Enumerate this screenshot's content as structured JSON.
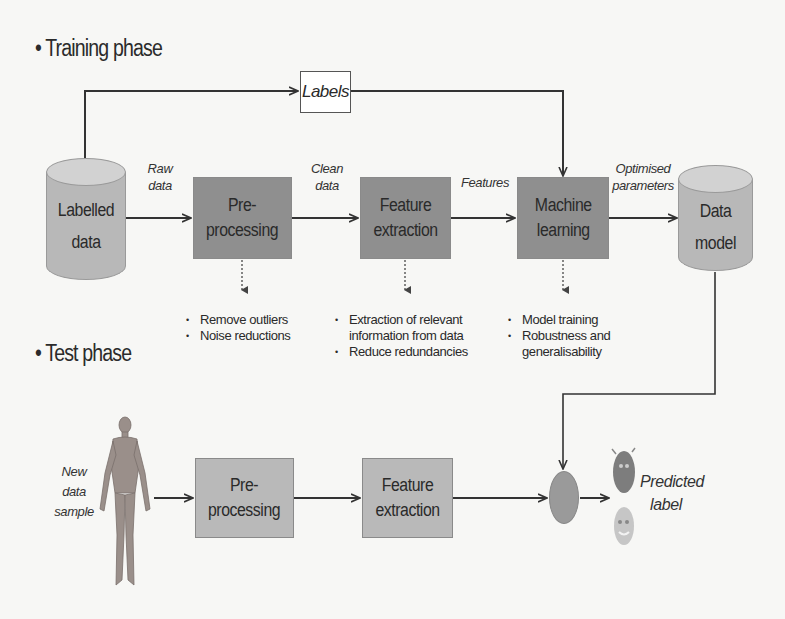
{
  "training": {
    "title": "• Training phase",
    "labels_box": "Labels",
    "source": {
      "line1": "Labelled",
      "line2": "data"
    },
    "edges": {
      "raw_data": {
        "line1": "Raw",
        "line2": "data"
      },
      "clean_data": {
        "line1": "Clean",
        "line2": "data"
      },
      "features": "Features",
      "optimised_parameters": {
        "line1": "Optimised",
        "line2": "parameters"
      }
    },
    "steps": [
      {
        "line1": "Pre-",
        "line2": "processing",
        "notes": [
          "Remove outliers",
          "Noise reductions"
        ]
      },
      {
        "line1": "Feature",
        "line2": "extraction",
        "notes": [
          "Extraction of relevant information from data",
          "Reduce redundancies"
        ]
      },
      {
        "line1": "Machine",
        "line2": "learning",
        "notes": [
          "Model training",
          "Robustness and generalisability"
        ]
      }
    ],
    "sink": {
      "line1": "Data",
      "line2": "model"
    }
  },
  "test": {
    "title": "• Test phase",
    "input_label": {
      "line1": "New",
      "line2": "data",
      "line3": "sample"
    },
    "steps": [
      {
        "line1": "Pre-",
        "line2": "processing"
      },
      {
        "line1": "Feature",
        "line2": "extraction"
      }
    ],
    "output_label": {
      "line1": "Predicted",
      "line2": "label"
    }
  },
  "notes_wrapped": {
    "fe_note1_line1": "Extraction of relevant",
    "fe_note1_line2": "information from data",
    "ml_note2_line1": "Robustness and",
    "ml_note2_line2": "generalisability"
  },
  "colors": {
    "background": "#f7f7f5",
    "training_box": "#8f8f8f",
    "test_box": "#b9b9b9",
    "cylinder": "#b8b8b8",
    "line": "#333333"
  }
}
